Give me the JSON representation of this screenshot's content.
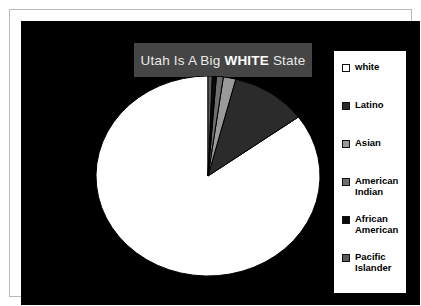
{
  "chart_data": {
    "type": "pie",
    "title": "Utah Is A Big WHITE State",
    "title_plain": "Utah Is A Big ",
    "title_bold": "WHITE",
    "title_tail": " State",
    "categories": [
      "white",
      "Latino",
      "Asian",
      "American Indian",
      "African American",
      "Pacific Islander"
    ],
    "values": [
      85.3,
      11.0,
      1.8,
      1.0,
      0.6,
      0.6
    ],
    "unit": "percent",
    "colors": [
      "#ffffff",
      "#2b2b2b",
      "#9a9a9a",
      "#6e6e6e",
      "#0a0a0a",
      "#5a5a5a"
    ],
    "legend_position": "right",
    "grid": false,
    "xlabel": "",
    "ylabel": "",
    "start_angle_deg": 0,
    "direction": "counterclockwise",
    "background": "#000000",
    "title_background": "#454545",
    "title_color": "#e9e9e9"
  },
  "legend": {
    "items": [
      {
        "label": "white",
        "swatch": "#ffffff"
      },
      {
        "label": "Latino",
        "swatch": "#2b2b2b"
      },
      {
        "label": "Asian",
        "swatch": "#9a9a9a"
      },
      {
        "label": "American Indian",
        "swatch": "#6e6e6e"
      },
      {
        "label": "African American",
        "swatch": "#0a0a0a"
      },
      {
        "label": "Pacific Islander",
        "swatch": "#5a5a5a"
      }
    ]
  }
}
